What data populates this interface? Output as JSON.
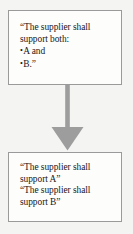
{
  "diagram": {
    "background_color": "#f4f4f2",
    "box_fill_color": "#fdfdfc",
    "box_border_color": "#9a9a9a",
    "arrow_color": "#9d9d9d",
    "text_color": "#17171a",
    "nodes": [
      {
        "id": "requirement-combined",
        "lines": [
          {
            "kind": "text",
            "text": "“The supplier shall"
          },
          {
            "kind": "text",
            "text": "support both:"
          },
          {
            "kind": "bullet",
            "bullet": "•",
            "text": "A and"
          },
          {
            "kind": "bullet",
            "bullet": "•",
            "text": "B.”"
          }
        ]
      },
      {
        "id": "requirement-split",
        "lines": [
          {
            "kind": "text",
            "text": "“The supplier shall"
          },
          {
            "kind": "text",
            "text": "support A”"
          },
          {
            "kind": "text",
            "text": "“The supplier shall"
          },
          {
            "kind": "text",
            "text": "support B”"
          }
        ]
      }
    ],
    "connector": {
      "id": "downward-arrow",
      "direction": "down",
      "from": "requirement-combined",
      "to": "requirement-split"
    }
  }
}
